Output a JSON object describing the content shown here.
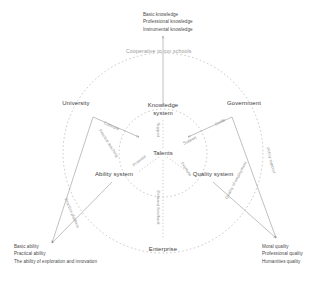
{
  "diagram": {
    "center_node": {
      "label": "Talents"
    },
    "inner_nodes": [
      {
        "id": "knowledge",
        "label": "Knowledge system"
      },
      {
        "id": "ability",
        "label": "Ability system"
      },
      {
        "id": "quality",
        "label": "Quality system"
      }
    ],
    "outer_nodes": [
      {
        "id": "university",
        "label": "University"
      },
      {
        "id": "government",
        "label": "Government"
      },
      {
        "id": "enterprise",
        "label": "Enterprise"
      }
    ],
    "ring_label": {
      "text": "Cooperative to run schools"
    },
    "outcome_blocks": [
      {
        "id": "knowledge-outcomes",
        "lines": [
          "Basic knowledge",
          "Professional knowledge",
          "Instrumental knowledge"
        ]
      },
      {
        "id": "ability-outcomes",
        "lines": [
          "Basic ability",
          "Practical ability",
          "The ability of exploration and innovation"
        ]
      },
      {
        "id": "quality-outcomes",
        "lines": [
          "Moral quality",
          "Professional quality",
          "Humanities quality"
        ]
      }
    ],
    "edge_labels": [
      {
        "id": "edge-university-knowledge",
        "text": "Cultivate"
      },
      {
        "id": "edge-university-ability",
        "text": "Practice teaching"
      },
      {
        "id": "edge-government-knowledge",
        "text": "Guide"
      },
      {
        "id": "edge-government-quality",
        "text": "Support"
      },
      {
        "id": "edge-enterprise-ability",
        "text": "Practice platform"
      },
      {
        "id": "edge-enterprise-quality",
        "text": "Quality of employment"
      },
      {
        "id": "edge-knowledge-talents",
        "text": "Support"
      },
      {
        "id": "edge-ability-talents",
        "text": "Promote"
      },
      {
        "id": "edge-quality-talents",
        "text": "Promote"
      },
      {
        "id": "edge-talents-enterprise",
        "text": "Demand feedback"
      },
      {
        "id": "edge-government-outer",
        "text": "Policy support"
      }
    ],
    "colors": {
      "line": "#8c8c8c",
      "text": "#4a4a4a",
      "muted": "#9a9a9a"
    }
  }
}
